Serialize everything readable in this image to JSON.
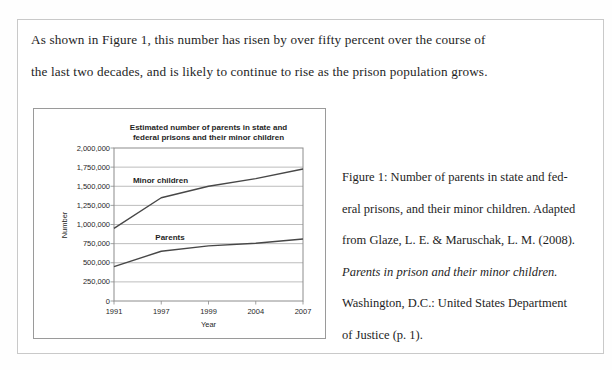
{
  "paragraph": {
    "line1": "As shown in Figure 1, this number has risen by over fifty percent over the course of",
    "line2": "the last two decades, and is likely to continue to rise as the prison population grows."
  },
  "caption": {
    "lines": [
      {
        "text": "Figure 1: Number of parents in state and fed-",
        "italic": false
      },
      {
        "text": "eral prisons, and their minor children. Adapted",
        "italic": false
      },
      {
        "text": "from Glaze, L. E. & Maruschak, L. M. (2008).",
        "italic": false
      },
      {
        "text": "Parents in prison and their minor children.",
        "italic": true
      },
      {
        "text": "Washington, D.C.: United States Department",
        "italic": false
      },
      {
        "text": "of Justice (p. 1).",
        "italic": false
      }
    ]
  },
  "chart_data": {
    "type": "line",
    "title_lines": [
      "Estimated number of parents in state and",
      "federal prisons and their minor children"
    ],
    "xlabel": "Year",
    "ylabel": "Number",
    "categories": [
      "1991",
      "1997",
      "1999",
      "2004",
      "2007"
    ],
    "series": [
      {
        "name": "Minor children",
        "values": [
          950000,
          1350000,
          1500000,
          1600000,
          1725000
        ]
      },
      {
        "name": "Parents",
        "values": [
          450000,
          650000,
          720000,
          755000,
          810000
        ]
      }
    ],
    "ylim": [
      0,
      2000000
    ],
    "ytick_step": 250000,
    "ytick_labels": [
      "0",
      "250,000",
      "500,000",
      "750,000",
      "1,000,000",
      "1,250,000",
      "1,500,000",
      "1,750,000",
      "2,000,000"
    ],
    "grid": true,
    "legend": "inline-labels",
    "colors": {
      "line": "#474747",
      "grid": "#ababab",
      "plot_border": "#8c8c8c",
      "tick": "#8c8c8c",
      "text": "#1f1f1f"
    }
  }
}
